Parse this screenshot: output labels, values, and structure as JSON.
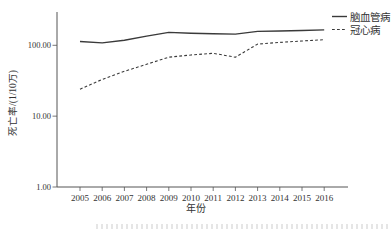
{
  "chart_data": {
    "type": "line",
    "title": "",
    "xlabel": "年份",
    "ylabel": "死亡率/(1/10万)",
    "y_scale": "log",
    "ylim": [
      1,
      300
    ],
    "grid": false,
    "legend_position": "top-right",
    "line_color": "#3a3a3a",
    "axis_color": "#555555",
    "y_ticks": [
      {
        "label": "1.00",
        "value": 1
      },
      {
        "label": "10.00",
        "value": 10
      },
      {
        "label": "100.00",
        "value": 100
      }
    ],
    "categories": [
      "2005",
      "2006",
      "2007",
      "2008",
      "2009",
      "2010",
      "2011",
      "2012",
      "2013",
      "2014",
      "2015",
      "2016"
    ],
    "series": [
      {
        "name": "脑血管病",
        "style": "solid",
        "values": [
          113,
          108,
          118,
          135,
          152,
          148,
          146,
          144,
          157,
          159,
          162,
          165
        ]
      },
      {
        "name": "冠心病",
        "style": "dashed",
        "values": [
          24,
          33,
          43,
          54,
          68,
          73,
          77,
          68,
          104,
          110,
          115,
          120
        ]
      }
    ]
  }
}
